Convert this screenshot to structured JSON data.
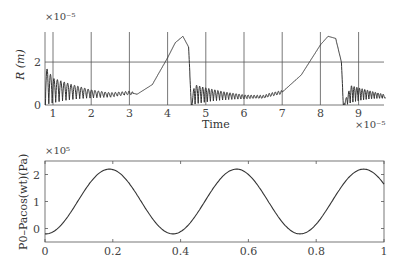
{
  "chart_data": [
    {
      "type": "line",
      "title": "",
      "xlabel": "Time",
      "ylabel": "R (m)",
      "x_multiplier": "×10⁻⁵",
      "y_multiplier": "×10⁻⁵",
      "xlim": [
        0.8,
        9.7
      ],
      "ylim": [
        0,
        3.4
      ],
      "xticks": [
        "1",
        "2",
        "3",
        "4",
        "5",
        "6",
        "7",
        "8",
        "9"
      ],
      "yticks": [
        "0",
        "2"
      ],
      "grid": true,
      "description": "Bubble radius oscillating; collapse-rebound oscillations decaying, then slow growth to peaks ~3.2 near t≈4.4 and t≈8.3, sharp collapse at ~4.6 and ~8.6",
      "series": [
        {
          "name": "R",
          "x": [
            0.8,
            1.0,
            1.5,
            2.0,
            2.5,
            3.0,
            3.2,
            3.6,
            4.0,
            4.2,
            4.4,
            4.55,
            4.62,
            4.7,
            5.0,
            5.5,
            6.0,
            6.5,
            7.0,
            7.5,
            8.0,
            8.2,
            8.4,
            8.55,
            8.6,
            8.8,
            9.2,
            9.7
          ],
          "y": [
            1.8,
            1.25,
            0.95,
            0.7,
            0.55,
            0.6,
            0.5,
            0.95,
            2.2,
            2.9,
            3.2,
            2.7,
            0.0,
            0.95,
            0.8,
            0.6,
            0.45,
            0.4,
            0.6,
            1.4,
            2.8,
            3.2,
            3.1,
            2.0,
            0.0,
            0.9,
            0.7,
            0.45
          ]
        }
      ]
    },
    {
      "type": "line",
      "title": "",
      "xlabel": "",
      "ylabel": "P0–Pacos(wt)(Pa)",
      "y_multiplier": "×10⁵",
      "xlim": [
        0,
        1
      ],
      "ylim": [
        -0.5,
        2.5
      ],
      "xticks": [
        "0",
        "0.2",
        "0.4",
        "0.6",
        "0.8",
        "1"
      ],
      "yticks": [
        "0",
        "1",
        "2"
      ],
      "grid": false,
      "series": [
        {
          "name": "P",
          "x": [
            0,
            0.05,
            0.1,
            0.15,
            0.19,
            0.25,
            0.3,
            0.35,
            0.38,
            0.45,
            0.5,
            0.56,
            0.6,
            0.65,
            0.7,
            0.75,
            0.8,
            0.85,
            0.9,
            0.94,
            0.98,
            1.0
          ],
          "y": [
            -0.2,
            0.1,
            0.9,
            1.8,
            2.2,
            1.8,
            0.9,
            0.0,
            -0.2,
            0.6,
            1.6,
            2.2,
            1.9,
            1.1,
            0.2,
            -0.2,
            0.3,
            1.2,
            2.0,
            2.2,
            2.0,
            1.8
          ]
        }
      ]
    }
  ],
  "labels": {
    "top_ylabel": "R (m)",
    "top_xlabel": "Time",
    "top_y_exp": "×10⁻⁵",
    "top_x_exp": "×10⁻⁵",
    "bottom_ylabel": "P0–Pacos(wt)(Pa)",
    "bottom_y_exp": "×10⁵"
  }
}
